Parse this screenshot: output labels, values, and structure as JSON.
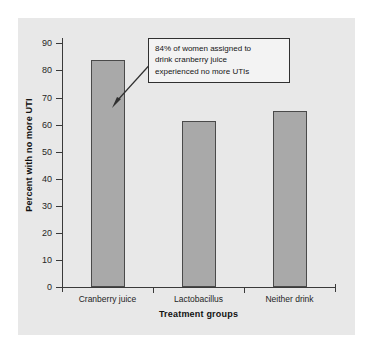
{
  "chart_data": {
    "type": "bar",
    "title": "",
    "xlabel": "Treatment groups",
    "ylabel": "Percent with no more UTI",
    "categories": [
      "Cranberry juice",
      "Lactobacillus",
      "Neither drink"
    ],
    "values": [
      84,
      61.5,
      65
    ],
    "ylim": [
      0,
      92
    ],
    "yticks": [
      0,
      10,
      20,
      30,
      40,
      50,
      60,
      70,
      80,
      90
    ],
    "ytick_labels": [
      "0",
      "10",
      "20",
      "30",
      "40",
      "50",
      "60",
      "70",
      "80",
      "90"
    ],
    "grid": false,
    "legend": "none",
    "bar_color": "#a9a9a9",
    "bar_edge_color": "#4a4a4a",
    "panel_color": "#e8e8e8",
    "annotations": [
      {
        "lines": [
          "84% of women assigned to",
          "drink cranberry juice",
          "experienced no more UTIs"
        ],
        "points_to": "Cranberry juice"
      }
    ]
  }
}
